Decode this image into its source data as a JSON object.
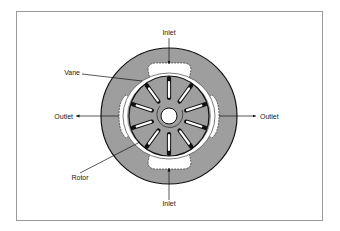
{
  "diagram": {
    "labels": {
      "inlet_top": "Inlet",
      "inlet_bottom": "Inlet",
      "outlet_left": "Outlet",
      "outlet_right": "Outlet",
      "vane": "Vane",
      "rotor": "Rotor"
    },
    "vane_count": 10,
    "colors": {
      "housing": "#9e9e9e",
      "outline": "#111111",
      "port": "#ffffff",
      "frame": "#9a9a9a"
    }
  }
}
